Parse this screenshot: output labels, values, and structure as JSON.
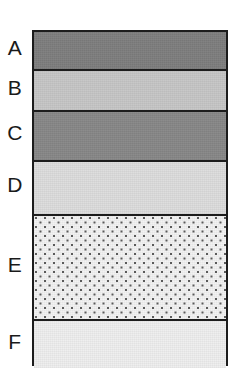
{
  "figure": {
    "type": "stratigraphic-column",
    "title": "",
    "background_color": "#ffffff",
    "outline_color": "#1c1c1c",
    "column": {
      "left": 32,
      "top": 30,
      "width": 196,
      "height": 336
    }
  },
  "layers": [
    {
      "label": "A",
      "fill": "#7d7d7d",
      "shade": "dark gray",
      "pattern": "solid",
      "top": 0,
      "height": 37,
      "label_center_y": 48
    },
    {
      "label": "B",
      "fill": "#c6c6c6",
      "shade": "light gray",
      "pattern": "solid",
      "top": 37,
      "height": 41,
      "label_center_y": 88
    },
    {
      "label": "C",
      "fill": "#878787",
      "shade": "dark gray",
      "pattern": "solid",
      "top": 78,
      "height": 50,
      "label_center_y": 133
    },
    {
      "label": "D",
      "fill": "#dcdcdc",
      "shade": "very light gray",
      "pattern": "solid",
      "top": 128,
      "height": 54,
      "label_center_y": 185
    },
    {
      "label": "E",
      "fill": "#f2f2f2",
      "shade": "near white",
      "pattern": "stipple-dots",
      "top": 182,
      "height": 105,
      "label_center_y": 265
    },
    {
      "label": "F",
      "fill": "#eeeeee",
      "shade": "near white",
      "pattern": "solid",
      "top": 287,
      "height": 49,
      "label_center_y": 342
    }
  ]
}
